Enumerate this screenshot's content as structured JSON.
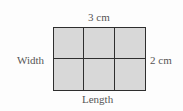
{
  "diagram": {
    "type": "area-grid",
    "rows": 2,
    "columns": 3,
    "labels": {
      "top": "3 cm",
      "left": "Width",
      "right": "2 cm",
      "bottom": "Length"
    },
    "colors": {
      "fill": "#d8d8d8",
      "line": "#2e2e2e",
      "text": "#555555"
    },
    "cells": [
      {
        "row": 1,
        "col": 1
      },
      {
        "row": 1,
        "col": 2
      },
      {
        "row": 1,
        "col": 3
      },
      {
        "row": 2,
        "col": 1
      },
      {
        "row": 2,
        "col": 2
      },
      {
        "row": 2,
        "col": 3
      }
    ]
  }
}
